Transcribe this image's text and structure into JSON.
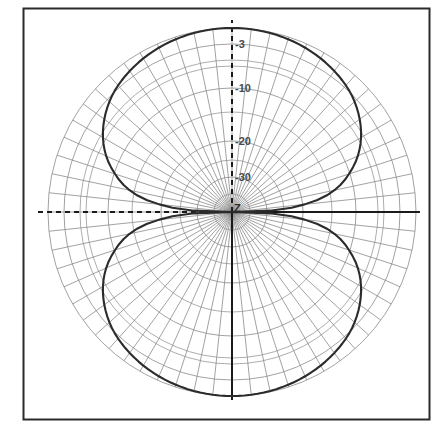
{
  "figure": {
    "kind": "polar-radiation-pattern",
    "frame": {
      "border_color": "#2b2b2b",
      "background": "#ffffff",
      "x": 23,
      "y": 8,
      "width": 407,
      "height": 412
    },
    "colors": {
      "grid": "#8a8a8a",
      "axis": "#1a1a1a",
      "curve": "#2b2b2b",
      "label": "#4a4a4a",
      "background": "#ffffff"
    }
  },
  "chart_data": {
    "type": "line",
    "subtype": "polar",
    "title": "",
    "xlabel": "",
    "ylabel": "",
    "units": "dB",
    "center": {
      "x": 232,
      "y": 212
    },
    "outer_radius_px": 184,
    "ring_labels": [
      "-3",
      "-10",
      "-20",
      "-30"
    ],
    "ring_values": [
      -3,
      -10,
      -20,
      -30
    ],
    "ring_radii_px": [
      168,
      124,
      71,
      35
    ],
    "center_label": "Z",
    "rlim": [
      -40,
      0
    ],
    "grid": true,
    "legend": null,
    "angular_spokes": 60,
    "angular_step_deg": 6,
    "axes": [
      {
        "name": "horizontal-left",
        "style": "dashed",
        "from_deg": 180,
        "to_px": 36
      },
      {
        "name": "horizontal-right",
        "style": "solid",
        "from_deg": 0,
        "to_px": 420
      },
      {
        "name": "vertical-up",
        "style": "dashed",
        "from_deg": 90,
        "to_px": 20
      },
      {
        "name": "vertical-down",
        "style": "solid",
        "from_deg": 270,
        "to_px": 400
      }
    ],
    "pattern": {
      "name": "dipole figure-eight",
      "formula_db": "20*log10(|cos(theta)|)",
      "lobes": 2,
      "lobe_peak_deg": [
        90,
        270
      ],
      "nulls_deg": [
        0,
        180
      ],
      "peak_value_db": 0,
      "beamwidth_3db_deg": 90,
      "samples_deg_step": 2,
      "series": [
        {
          "name": "pattern",
          "theta_deg": [
            0,
            6,
            12,
            18,
            24,
            30,
            36,
            42,
            48,
            54,
            60,
            66,
            72,
            78,
            84,
            90,
            96,
            102,
            108,
            114,
            120,
            126,
            132,
            138,
            144,
            150,
            156,
            162,
            168,
            174,
            180,
            186,
            192,
            198,
            204,
            210,
            216,
            222,
            228,
            234,
            240,
            246,
            252,
            258,
            264,
            270,
            276,
            282,
            288,
            294,
            300,
            306,
            312,
            318,
            324,
            330,
            336,
            342,
            348,
            354
          ],
          "values_db": [
            -40,
            -39.6,
            -33.6,
            -30.1,
            -27.7,
            -25.8,
            -24.3,
            -23.0,
            -21.9,
            -21.0,
            -20.2,
            -19.5,
            -18.9,
            -18.4,
            -18.0,
            -17.8,
            -18.0,
            -18.4,
            -18.9,
            -19.5,
            -20.2,
            -21.0,
            -21.9,
            -23.0,
            -24.3,
            -25.8,
            -27.7,
            -30.1,
            -33.6,
            -39.6,
            -40,
            -39.6,
            -33.6,
            -30.1,
            -27.7,
            -25.8,
            -24.3,
            -23.0,
            -21.9,
            -21.0,
            -20.2,
            -19.5,
            -18.9,
            -18.4,
            -18.0,
            -17.8,
            -18.0,
            -18.4,
            -18.9,
            -19.5,
            -20.2,
            -21.0,
            -21.9,
            -23.0,
            -24.3,
            -25.8,
            -27.7,
            -30.1,
            -33.6,
            -39.6
          ]
        }
      ]
    }
  }
}
